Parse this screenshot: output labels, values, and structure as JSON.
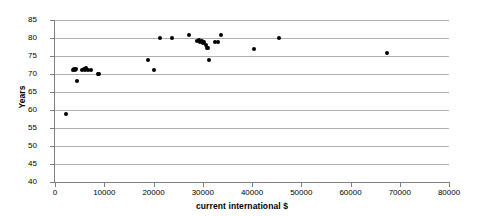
{
  "chart_data": {
    "type": "scatter",
    "title": "",
    "xlabel": "current international $",
    "ylabel": "Years",
    "xlim": [
      0,
      80000
    ],
    "ylim": [
      40,
      85
    ],
    "xticks": [
      0,
      10000,
      20000,
      30000,
      40000,
      50000,
      60000,
      70000,
      80000
    ],
    "yticks": [
      40,
      45,
      50,
      55,
      60,
      65,
      70,
      75,
      80,
      85
    ],
    "xtick_labels": [
      "0",
      "10000",
      "20000",
      "30000",
      "40000",
      "50000",
      "60000",
      "70000",
      "80000"
    ],
    "ytick_labels": [
      "40",
      "45",
      "50",
      "55",
      "60",
      "65",
      "70",
      "75",
      "80",
      "85"
    ],
    "grid": "horizontal",
    "legend": "none",
    "marker": "filled-circle",
    "marker_color": "#000000",
    "points": [
      {
        "x": 2300,
        "y": 59.0
      },
      {
        "x": 3600,
        "y": 71.2
      },
      {
        "x": 3900,
        "y": 71.5
      },
      {
        "x": 4000,
        "y": 71.0
      },
      {
        "x": 4200,
        "y": 71.3
      },
      {
        "x": 4400,
        "y": 68.0
      },
      {
        "x": 5400,
        "y": 71.2
      },
      {
        "x": 5800,
        "y": 71.5
      },
      {
        "x": 6000,
        "y": 71.0
      },
      {
        "x": 6200,
        "y": 71.6
      },
      {
        "x": 6600,
        "y": 71.2
      },
      {
        "x": 7300,
        "y": 71.0
      },
      {
        "x": 8700,
        "y": 69.9
      },
      {
        "x": 9000,
        "y": 69.9
      },
      {
        "x": 18800,
        "y": 74.0
      },
      {
        "x": 20000,
        "y": 71.0
      },
      {
        "x": 21400,
        "y": 80.0
      },
      {
        "x": 23800,
        "y": 80.0
      },
      {
        "x": 27200,
        "y": 80.8
      },
      {
        "x": 28800,
        "y": 79.2
      },
      {
        "x": 29200,
        "y": 79.4
      },
      {
        "x": 29400,
        "y": 79.0
      },
      {
        "x": 29800,
        "y": 79.3
      },
      {
        "x": 30000,
        "y": 78.6
      },
      {
        "x": 30300,
        "y": 78.9
      },
      {
        "x": 30600,
        "y": 78.0
      },
      {
        "x": 30900,
        "y": 77.3
      },
      {
        "x": 31100,
        "y": 77.2
      },
      {
        "x": 31300,
        "y": 74.0
      },
      {
        "x": 32400,
        "y": 78.8
      },
      {
        "x": 33000,
        "y": 78.9
      },
      {
        "x": 33700,
        "y": 80.8
      },
      {
        "x": 40400,
        "y": 77.0
      },
      {
        "x": 45500,
        "y": 80.0
      },
      {
        "x": 67400,
        "y": 75.8
      }
    ]
  }
}
